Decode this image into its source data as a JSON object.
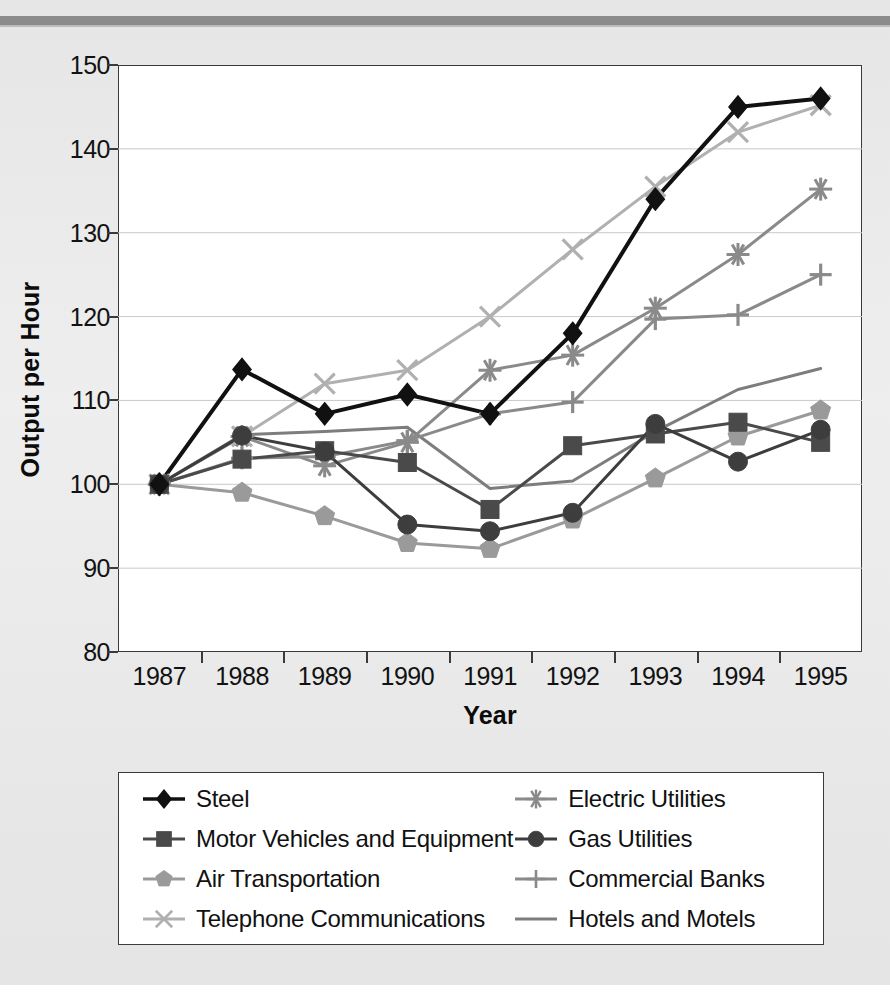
{
  "chart_data": {
    "type": "line",
    "title": "",
    "xlabel": "Year",
    "ylabel": "Output per Hour",
    "categories": [
      "1987",
      "1988",
      "1989",
      "1990",
      "1991",
      "1992",
      "1993",
      "1994",
      "1995"
    ],
    "x": [
      1987,
      1988,
      1989,
      1990,
      1991,
      1992,
      1993,
      1994,
      1995
    ],
    "ylim": [
      80,
      150
    ],
    "yticks": [
      80,
      90,
      100,
      110,
      120,
      130,
      140,
      150
    ],
    "grid": true,
    "legend_position": "below",
    "legend_columns": 2,
    "series": [
      {
        "name": "Steel",
        "marker": "diamond",
        "color": "#111111",
        "values": [
          100,
          113.7,
          108.4,
          110.7,
          108.4,
          118,
          134,
          145,
          146
        ]
      },
      {
        "name": "Motor Vehicles and Equipment",
        "marker": "square",
        "color": "#4a4a4a",
        "values": [
          100,
          103,
          104,
          102.6,
          97,
          104.6,
          106,
          107.4,
          105
        ]
      },
      {
        "name": "Air Transportation",
        "marker": "pentagon",
        "color": "#9a9a9a",
        "values": [
          100,
          99,
          96.2,
          93,
          92.3,
          95.8,
          100.7,
          105.7,
          108.8
        ]
      },
      {
        "name": "Telephone Communications",
        "marker": "x",
        "color": "#b0b0b0",
        "values": [
          100,
          105.7,
          112,
          113.6,
          120,
          128,
          135.5,
          142,
          145.2
        ]
      },
      {
        "name": "Electric Utilities",
        "marker": "asterisk",
        "color": "#8a8a8a",
        "values": [
          100,
          105.7,
          102.2,
          105,
          113.6,
          115.4,
          121,
          127.4,
          135.2
        ]
      },
      {
        "name": "Gas Utilities",
        "marker": "circle",
        "color": "#3d3d3d",
        "values": [
          100,
          105.8,
          103.9,
          95.2,
          94.4,
          96.6,
          107.2,
          102.7,
          106.5
        ]
      },
      {
        "name": "Commercial Banks",
        "marker": "plus",
        "color": "#8a8a8a",
        "values": [
          100,
          103.1,
          103.3,
          105.2,
          108.4,
          109.8,
          119.7,
          120.2,
          125
        ]
      },
      {
        "name": "Hotels and Motels",
        "marker": "none",
        "color": "#7d7d7d",
        "values": [
          100,
          105.9,
          106.3,
          106.8,
          99.5,
          100.4,
          106.3,
          111.3,
          113.8
        ]
      }
    ]
  },
  "legend": {
    "items": [
      {
        "label": "Steel"
      },
      {
        "label": "Electric Utilities"
      },
      {
        "label": "Motor Vehicles and Equipment"
      },
      {
        "label": "Gas Utilities"
      },
      {
        "label": "Air Transportation"
      },
      {
        "label": "Commercial Banks"
      },
      {
        "label": "Telephone Communications"
      },
      {
        "label": "Hotels and Motels"
      }
    ]
  }
}
